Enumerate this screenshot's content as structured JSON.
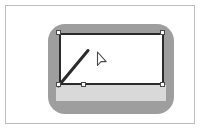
{
  "figure": {
    "title": "Rectangle shape selected on canvas",
    "colors": {
      "page_background": "#ffffff",
      "frame_border": "#bdbdbd",
      "canvas_plate": "#9e9e9e",
      "back_band": "#d9d9d9",
      "triangle_fill": "#d4d4d4",
      "rectangle_fill": "#ffffff",
      "rectangle_stroke": "#2b2b2b",
      "line_stroke": "#2b2b2b",
      "handle_fill": "#fdfdfd",
      "handle_stroke": "#4a4a4a",
      "cursor_fill": "#ffffff",
      "cursor_stroke": "#4a4a4a"
    }
  },
  "canvas": {
    "label": "Drawing canvas",
    "plate_label": "Rounded gray canvas plate",
    "band_label": "Light gray background band"
  },
  "shapes": [
    {
      "name": "rectangle",
      "label": "White rectangle",
      "selected": "true",
      "fill": "#ffffff",
      "stroke": "#2b2b2b",
      "stroke_width": "2"
    },
    {
      "name": "triangle",
      "label": "Light gray triangle",
      "selected": "false",
      "fill": "#d4d4d4",
      "stroke": "none"
    },
    {
      "name": "line",
      "label": "Diagonal line",
      "selected": "false",
      "stroke": "#2b2b2b",
      "stroke_width": "3"
    }
  ],
  "selection": {
    "label": "Selection handles",
    "handle_count": "6",
    "handles": [
      {
        "name": "top-left",
        "x": "50",
        "y": "24"
      },
      {
        "name": "top-right",
        "x": "155",
        "y": "24"
      },
      {
        "name": "bottom-left",
        "x": "50",
        "y": "76"
      },
      {
        "name": "bottom-right",
        "x": "155",
        "y": "76"
      },
      {
        "name": "inner-bottom",
        "x": "75",
        "y": "76"
      },
      {
        "name": "inner-left",
        "x": "50",
        "y": "76"
      }
    ]
  },
  "cursor": {
    "label": "Mouse pointer",
    "type": "arrow-cursor",
    "x": "90",
    "y": "45"
  }
}
